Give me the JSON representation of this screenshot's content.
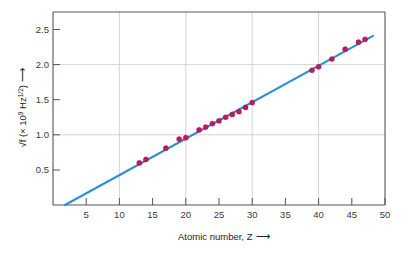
{
  "chart_data": {
    "type": "scatter",
    "title": "",
    "xlabel": "Atomic number, Z",
    "xlabel_arrow": "⟶",
    "ylabel_prefix": "√f",
    "ylabel_units": "(× 10",
    "ylabel_exp": "9",
    "ylabel_units2": " Hz",
    "ylabel_exp2": "1/2",
    "ylabel_close": ")",
    "ylabel_arrow": "⟶",
    "xlim": [
      0,
      50
    ],
    "ylim": [
      0,
      2.75
    ],
    "xticks": [
      5,
      10,
      15,
      20,
      25,
      30,
      35,
      40,
      45,
      50
    ],
    "xtick_labels": [
      "5",
      "10",
      "15",
      "20",
      "25",
      "30",
      "35",
      "40",
      "45",
      "50"
    ],
    "yticks": [
      0.5,
      1.0,
      1.5,
      2.0,
      2.5
    ],
    "ytick_labels": [
      "0.5",
      "1.0",
      "1.5",
      "2.0",
      "2.5"
    ],
    "xgrid_values": [
      10,
      20,
      30,
      40
    ],
    "ygrid_values": [
      1.0,
      2.0
    ],
    "grid": true,
    "legend": "none",
    "point_color": "#c3185a",
    "line_color": "#2a8fd4",
    "series": [
      {
        "name": "K-alpha X-ray data",
        "x": [
          13,
          14,
          17,
          19,
          20,
          22,
          23,
          24,
          25,
          26,
          27,
          28,
          29,
          30,
          39,
          40,
          42,
          44,
          46,
          47
        ],
        "y": [
          0.6,
          0.65,
          0.81,
          0.94,
          0.96,
          1.07,
          1.11,
          1.16,
          1.2,
          1.25,
          1.29,
          1.33,
          1.39,
          1.46,
          1.92,
          1.97,
          2.08,
          2.22,
          2.32,
          2.36
        ]
      }
    ],
    "fit_line": {
      "name": "Moseley best fit",
      "x": [
        1.8,
        48.2
      ],
      "y": [
        0.0,
        2.41
      ]
    }
  }
}
